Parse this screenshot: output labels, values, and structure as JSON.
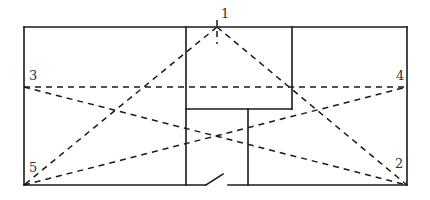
{
  "diagram": {
    "type": "floor-plan-sightlines",
    "colors": {
      "line": "#1a1a1a",
      "label": "#333333",
      "background": "#ffffff"
    },
    "points": [
      {
        "id": "1",
        "label": "1",
        "x": 217,
        "y": 27,
        "label_x": 221,
        "label_y": 18
      },
      {
        "id": "2",
        "label": "2",
        "x": 407,
        "y": 185,
        "label_x": 395,
        "label_y": 168
      },
      {
        "id": "3",
        "label": "3",
        "x": 24,
        "y": 87,
        "label_x": 29,
        "label_y": 80
      },
      {
        "id": "4",
        "label": "4",
        "x": 407,
        "y": 87,
        "label_x": 396,
        "label_y": 80
      },
      {
        "id": "5",
        "label": "5",
        "x": 24,
        "y": 185,
        "label_x": 29,
        "label_y": 172
      }
    ],
    "sightlines": [
      {
        "from": "1",
        "to": "5"
      },
      {
        "from": "1",
        "to": "2"
      },
      {
        "from": "3",
        "to": "4"
      },
      {
        "from": "3",
        "to": "2"
      },
      {
        "from": "5",
        "to": "4"
      },
      {
        "from": "1",
        "to": "tick"
      }
    ]
  }
}
